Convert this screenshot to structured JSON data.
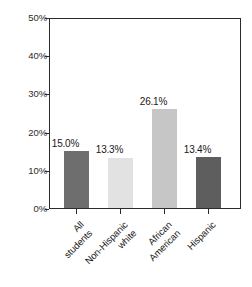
{
  "chart_data": {
    "type": "bar",
    "title": "",
    "subtitle": "",
    "xlabel": "",
    "ylabel": "",
    "ylim": [
      0,
      50
    ],
    "y_ticks": [
      0,
      10,
      20,
      30,
      40,
      50
    ],
    "y_tick_labels": [
      "0%",
      "10%",
      "20%",
      "30%",
      "40%",
      "50%"
    ],
    "grid": false,
    "legend": "none",
    "categories": [
      "All students",
      "Non-Hispanic white",
      "African American",
      "Hispanic"
    ],
    "category_lines": [
      [
        "All",
        "students"
      ],
      [
        "Non-Hispanic",
        "white"
      ],
      [
        "African",
        "American"
      ],
      [
        "Hispanic"
      ]
    ],
    "values": [
      15.0,
      13.3,
      26.1,
      13.4
    ],
    "value_labels": [
      "15.0%",
      "13.3%",
      "26.1%",
      "13.4%"
    ],
    "bar_colors": [
      "#6e6e6e",
      "#e2e2e2",
      "#c6c6c6",
      "#5e5e5e"
    ],
    "axis_color": "#2b2b2b",
    "background": "#ffffff"
  }
}
